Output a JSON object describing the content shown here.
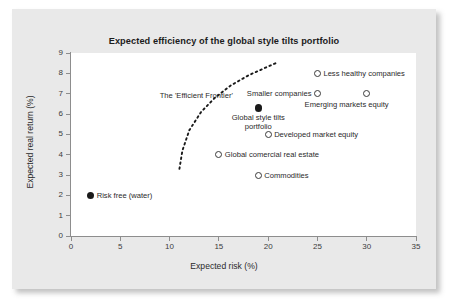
{
  "chart_data": {
    "type": "scatter",
    "title": "Expected efficiency of the global style tilts portfolio",
    "xlabel": "Expected risk (%)",
    "ylabel": "Expected real return (%)",
    "xlim": [
      0,
      35
    ],
    "ylim": [
      0,
      9
    ],
    "xticks": [
      0,
      5,
      10,
      15,
      20,
      25,
      30,
      35
    ],
    "yticks": [
      0,
      1,
      2,
      3,
      4,
      5,
      6,
      7,
      8,
      9
    ],
    "grid": false,
    "legend": "none",
    "points": [
      {
        "label": "Less healthy companies",
        "x": 25.0,
        "y": 8.0,
        "marker": "open",
        "label_position": "right"
      },
      {
        "label": "Smaller companies",
        "x": 25.0,
        "y": 7.0,
        "marker": "open",
        "label_position": "left"
      },
      {
        "label": "Emerging markets equity",
        "x": 30.0,
        "y": 7.0,
        "marker": "open",
        "label_position": "below"
      },
      {
        "label": "Global style tilts portfolio",
        "x": 19.0,
        "y": 6.3,
        "marker": "filled",
        "label_position": "below"
      },
      {
        "label": "Developed market equity",
        "x": 20.0,
        "y": 5.0,
        "marker": "open",
        "label_position": "right"
      },
      {
        "label": "Global comercial real estate",
        "x": 15.0,
        "y": 4.0,
        "marker": "open",
        "label_position": "right"
      },
      {
        "label": "Commodities",
        "x": 19.0,
        "y": 3.0,
        "marker": "open",
        "label_position": "right"
      },
      {
        "label": "Risk free (water)",
        "x": 2.0,
        "y": 2.0,
        "marker": "filled",
        "label_position": "right"
      }
    ],
    "annotations": [
      {
        "label": "The 'Efficient Frontier'",
        "x": 9.0,
        "y": 6.9
      }
    ],
    "curves": [
      {
        "name": "Efficient Frontier",
        "style": "dashed",
        "color": "#1a1a1a",
        "x": [
          11.0,
          11.3,
          12.0,
          13.2,
          14.6,
          16.2,
          18.0,
          19.6,
          21.0
        ],
        "y": [
          3.3,
          4.2,
          5.2,
          6.1,
          6.8,
          7.4,
          7.9,
          8.25,
          8.55
        ]
      }
    ]
  },
  "colors": {
    "card_background": "#e9e9e9",
    "plot_background": "#ffffff",
    "axis": "#8d8d8d",
    "marker_outline": "#3a3a3a",
    "marker_fill": "#1a1a1a",
    "text": "#2a2a2a"
  }
}
